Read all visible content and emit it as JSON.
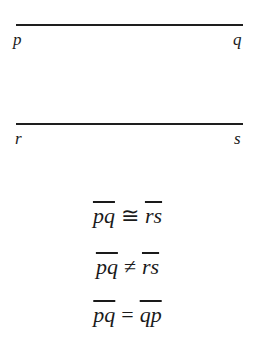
{
  "figure": {
    "segments": [
      {
        "name": "pq",
        "start_label": "p",
        "end_label": "q"
      },
      {
        "name": "rs",
        "start_label": "r",
        "end_label": "s"
      }
    ],
    "equations": [
      {
        "left": "pq",
        "op": "≅",
        "right": "rs"
      },
      {
        "left": "pq",
        "op": "≠",
        "right": "rs"
      },
      {
        "left": "pq",
        "op": "=",
        "right": "qp"
      }
    ]
  }
}
